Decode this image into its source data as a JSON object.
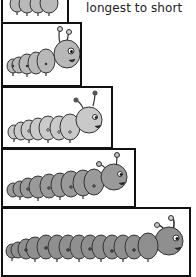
{
  "caption": "longest to short",
  "boxes": [
    {
      "id": 1,
      "label": "caterpillar-1",
      "segments": 4,
      "shade": "#b9b9b9"
    },
    {
      "id": 2,
      "label": "caterpillar-2",
      "segments": 6,
      "shade": "#b8b8b8"
    },
    {
      "id": 3,
      "label": "caterpillar-3",
      "segments": 8,
      "shade": "#c9c9c9"
    },
    {
      "id": 4,
      "label": "caterpillar-4",
      "segments": 10,
      "shade": "#9a9a9a"
    },
    {
      "id": 5,
      "label": "caterpillar-5",
      "segments": 14,
      "shade": "#8f8f8f"
    }
  ],
  "colors": {
    "outline": "#111111",
    "background": "#ffffff"
  }
}
